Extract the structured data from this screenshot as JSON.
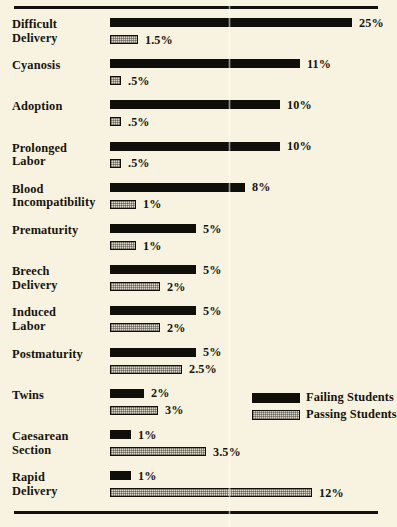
{
  "chart_data": {
    "type": "bar",
    "orientation": "horizontal",
    "title": "",
    "subtitle": "",
    "xlabel": "",
    "ylabel": "",
    "grid": false,
    "legend_position": "bottom-right",
    "value_suffix": "%",
    "categories": [
      "Difficult Delivery",
      "Cyanosis",
      "Adoption",
      "Prolonged Labor",
      "Blood Incompatibility",
      "Prematurity",
      "Breech Delivery",
      "Induced Labor",
      "Postmaturity",
      "Twins",
      "Caesarean Section",
      "Rapid Delivery"
    ],
    "series": [
      {
        "name": "Failing Students",
        "color": "#100e09",
        "style": "solid-black",
        "values": [
          25,
          11,
          10,
          10,
          8,
          5,
          5,
          5,
          5,
          2,
          1,
          1
        ],
        "labels": [
          "25%",
          "11%",
          "10%",
          "10%",
          "8%",
          "5%",
          "5%",
          "5%",
          "5%",
          "2%",
          "1%",
          "1%"
        ]
      },
      {
        "name": "Passing Students",
        "color": "#d8d5c6",
        "style": "hatched-gray",
        "values": [
          1.5,
          0.5,
          0.5,
          0.5,
          1,
          1,
          2,
          2,
          2.5,
          3,
          3.5,
          12
        ],
        "labels": [
          "1.5%",
          ".5%",
          ".5%",
          ".5%",
          "1%",
          "1%",
          "2%",
          "2%",
          "2.5%",
          "3%",
          "3.5%",
          "12%"
        ]
      }
    ]
  },
  "rows": [
    {
      "label_lines": [
        "Difficult",
        "Delivery"
      ],
      "failing": {
        "label": "25%",
        "px": 242
      },
      "passing": {
        "label": "1.5%",
        "px": 28
      }
    },
    {
      "label_lines": [
        "Cyanosis"
      ],
      "failing": {
        "label": "11%",
        "px": 190
      },
      "passing": {
        "label": ".5%",
        "px": 11
      }
    },
    {
      "label_lines": [
        "Adoption"
      ],
      "failing": {
        "label": "10%",
        "px": 170
      },
      "passing": {
        "label": ".5%",
        "px": 11
      }
    },
    {
      "label_lines": [
        "Prolonged",
        "Labor"
      ],
      "failing": {
        "label": "10%",
        "px": 170
      },
      "passing": {
        "label": ".5%",
        "px": 11
      }
    },
    {
      "label_lines": [
        "Blood",
        "Incompatibility"
      ],
      "failing": {
        "label": "8%",
        "px": 135
      },
      "passing": {
        "label": "1%",
        "px": 26
      }
    },
    {
      "label_lines": [
        "Prematurity"
      ],
      "failing": {
        "label": "5%",
        "px": 86
      },
      "passing": {
        "label": "1%",
        "px": 26
      }
    },
    {
      "label_lines": [
        "Breech",
        "Delivery"
      ],
      "failing": {
        "label": "5%",
        "px": 86
      },
      "passing": {
        "label": "2%",
        "px": 50
      }
    },
    {
      "label_lines": [
        "Induced",
        "Labor"
      ],
      "failing": {
        "label": "5%",
        "px": 86
      },
      "passing": {
        "label": "2%",
        "px": 50
      }
    },
    {
      "label_lines": [
        "Postmaturity"
      ],
      "failing": {
        "label": "5%",
        "px": 86
      },
      "passing": {
        "label": "2.5%",
        "px": 72
      }
    },
    {
      "label_lines": [
        "Twins"
      ],
      "failing": {
        "label": "2%",
        "px": 34
      },
      "passing": {
        "label": "3%",
        "px": 48
      }
    },
    {
      "label_lines": [
        "Caesarean",
        "Section"
      ],
      "failing": {
        "label": "1%",
        "px": 21
      },
      "passing": {
        "label": "3.5%",
        "px": 96
      }
    },
    {
      "label_lines": [
        "Rapid",
        "Delivery"
      ],
      "failing": {
        "label": "1%",
        "px": 21
      },
      "passing": {
        "label": "12%",
        "px": 202
      }
    }
  ],
  "legend": {
    "items": [
      {
        "label": "Failing Students",
        "style": "failing"
      },
      {
        "label": "Passing Students",
        "style": "passing"
      }
    ]
  }
}
